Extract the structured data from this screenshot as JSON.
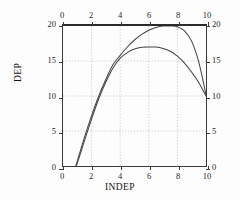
{
  "chart_data": {
    "type": "line",
    "title": "",
    "xlabel": "INDEP",
    "ylabel": "DEP",
    "xlim": [
      0,
      10
    ],
    "ylim": [
      0,
      20
    ],
    "grid": true,
    "legend": "none",
    "axes": {
      "bottom": {
        "label": "INDEP",
        "ticks": [
          0,
          2,
          4,
          6,
          8,
          10
        ],
        "tick_labels": [
          "0",
          "2",
          "4",
          "6",
          "8",
          "10"
        ]
      },
      "top": {
        "label": "",
        "ticks": [
          0,
          2,
          4,
          6,
          8,
          10
        ],
        "tick_labels": [
          "0",
          "2",
          "4",
          "6",
          "8",
          "10"
        ]
      },
      "left": {
        "label": "DEP",
        "ticks": [
          0,
          5,
          10,
          15,
          20
        ],
        "tick_labels": [
          "0",
          "5",
          "10",
          "15",
          "20"
        ]
      },
      "right": {
        "label": "",
        "ticks": [
          0,
          5,
          10,
          15,
          20
        ],
        "tick_labels": [
          "0",
          "5",
          "10",
          "15",
          "20"
        ]
      }
    },
    "x": [
      0.9,
      1.0,
      1.5,
      2.0,
      2.5,
      3.0,
      3.5,
      4.0,
      4.5,
      5.0,
      5.5,
      6.0,
      6.5,
      7.0,
      7.5,
      8.0,
      8.5,
      9.0,
      9.5,
      10.0
    ],
    "series": [
      {
        "name": "upper-curve",
        "color": "#444444",
        "peak_x": 8.0,
        "peak_y": 20.0,
        "values": [
          0.0,
          0.7,
          4.1,
          7.2,
          10.0,
          12.4,
          14.5,
          15.8,
          17.0,
          18.0,
          18.8,
          19.4,
          19.8,
          20.0,
          20.0,
          19.9,
          19.3,
          17.8,
          14.8,
          10.2
        ]
      },
      {
        "name": "lower-curve",
        "color": "#444444",
        "peak_x": 6.5,
        "peak_y": 17.0,
        "values": [
          0.0,
          0.4,
          3.6,
          6.7,
          9.6,
          12.0,
          14.0,
          15.4,
          16.2,
          16.7,
          16.95,
          17.0,
          17.0,
          16.8,
          16.4,
          15.7,
          14.7,
          13.4,
          11.9,
          10.0
        ]
      }
    ],
    "gridlines": {
      "x": [
        2,
        4,
        6,
        8
      ],
      "y": [
        5,
        10,
        15
      ]
    }
  },
  "colors": {
    "frame": "#3a3a3a",
    "curve": "#444444",
    "grid": "#9a9a9a",
    "text": "#1f1f1f",
    "background": "#fdfdfd"
  }
}
